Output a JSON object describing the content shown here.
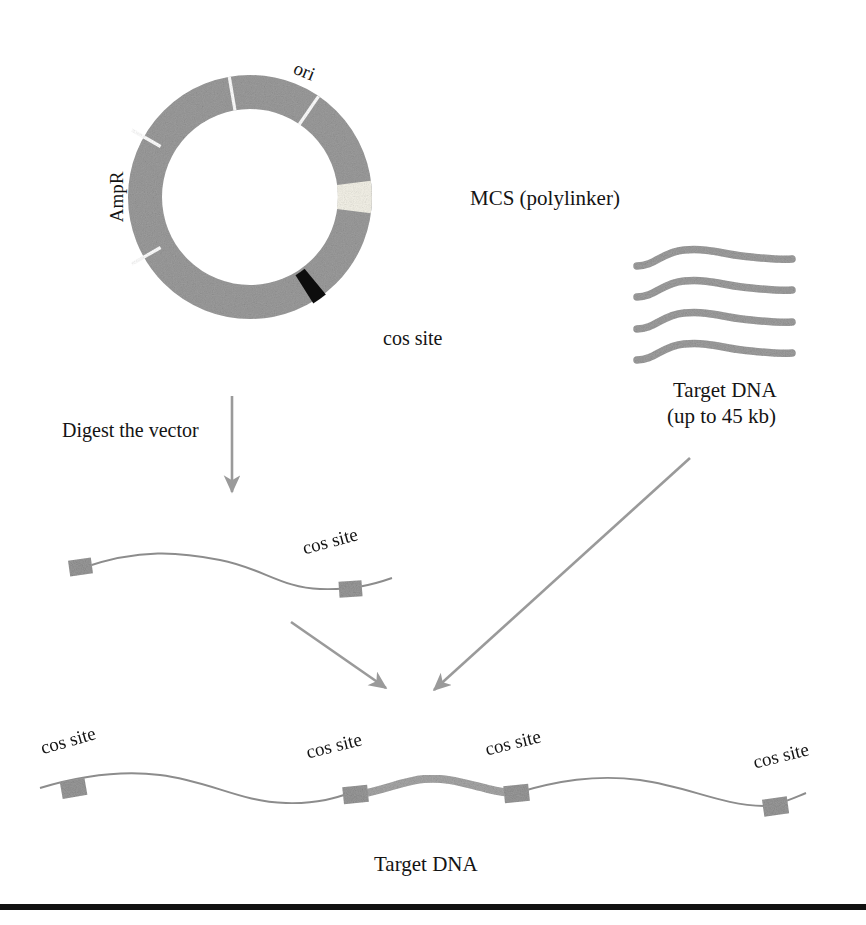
{
  "figure": {
    "bg_color": "#ffffff",
    "dna_gray": "#9a9a9a",
    "ring_gray": "#9c9c9c",
    "line_gray": "#8c8c8c",
    "arrow_gray": "#9a9a9a",
    "cos_black": "#111111",
    "mcs_cream": "#f2f0e6",
    "rule_black": "#111111",
    "text_color": "#141414"
  },
  "plasmid": {
    "name": "cosmid-vector-plasmid",
    "center_x": 250,
    "center_y": 197,
    "outer_radius": 122,
    "inner_radius": 88,
    "segments": [
      {
        "name": "ori-segment",
        "label": "ori",
        "start_deg": -100,
        "end_deg": -56,
        "fill": "#9c9c9c",
        "label_rotation": -10
      },
      {
        "name": "ampr-segment",
        "label": "AmpR",
        "start_deg": 145,
        "end_deg": 215,
        "fill": "#9c9c9c",
        "label_rotation": -90
      },
      {
        "name": "mcs-segment",
        "label": "MCS (polylinker)",
        "start_deg": -8,
        "end_deg": 9,
        "fill": "#f2f0e6",
        "label_rotation": 0
      },
      {
        "name": "cos-site-segment",
        "label": "cos site",
        "start_deg": 52,
        "end_deg": 58,
        "fill": "#111111",
        "label_rotation": 0
      }
    ],
    "labels": {
      "ori": "ori",
      "ampr": "AmpR",
      "mcs": "MCS (polylinker)",
      "cos_site": "cos site"
    }
  },
  "target_dna_source": {
    "name": "target-dna-strands",
    "strand_count": 4,
    "caption_line1": "Target DNA",
    "caption_line2": "(up to 45 kb)",
    "color": "#9a9a9a"
  },
  "digest_step": {
    "name": "digest-the-vector-step",
    "label": "Digest the vector",
    "arrow_color": "#9a9a9a"
  },
  "linear_vector": {
    "name": "linearized-vector",
    "cos_label": "cos site",
    "cos_site_count": 2,
    "line_color": "#8c8c8c",
    "block_color": "#9a9a9a"
  },
  "ligation_arrows": {
    "name": "ligation-convergence-arrows",
    "count": 2,
    "color": "#9a9a9a"
  },
  "final_construct": {
    "name": "concatemer-construct",
    "caption": "Target DNA",
    "cos_labels": [
      "cos site",
      "cos site",
      "cos site",
      "cos site"
    ],
    "cos_site_count": 4,
    "vector_line_color": "#8c8c8c",
    "insert_color": "#a8a8a8",
    "block_color": "#9a9a9a"
  },
  "bottom_rule": {
    "name": "bottom-divider-rule",
    "color": "#111111",
    "thickness_px": 6
  }
}
